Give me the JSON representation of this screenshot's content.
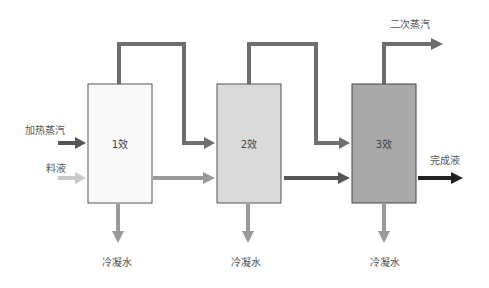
{
  "diagram": {
    "effects": [
      {
        "label": "1效",
        "fill": "#f8f8f8"
      },
      {
        "label": "2效",
        "fill": "#dadada"
      },
      {
        "label": "3效",
        "fill": "#a9a9a9"
      }
    ],
    "inputs": {
      "heating_steam": "加热蒸汽",
      "feed": "料液"
    },
    "outputs": {
      "secondary_steam": "二次蒸汽",
      "product": "完成液",
      "condensate": [
        "冷凝水",
        "冷凝水",
        "冷凝水"
      ]
    },
    "colors": {
      "steam_pipe": "#6e6e6e",
      "heating_arrow": "#555555",
      "feed_arrow": "#c8c8c8",
      "liquor_1_2": "#999999",
      "liquor_2_3": "#555555",
      "product_arrow": "#222222",
      "condensate_arrow": "#9a9a9a",
      "box_border": "#555555"
    }
  }
}
